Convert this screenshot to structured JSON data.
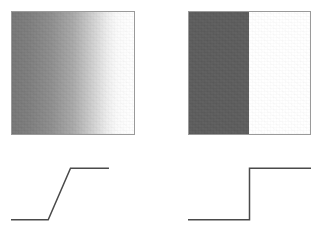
{
  "figure": {
    "background_color": "#ffffff",
    "width": 323,
    "height": 242
  },
  "panels": [
    {
      "id": "ramp",
      "stimulus_label": "gradient ramp edge",
      "profile_label": "gradual intensity ramp profile"
    },
    {
      "id": "step",
      "stimulus_label": "sharp step edge",
      "profile_label": "abrupt intensity step profile"
    }
  ],
  "stimuli": {
    "ramp": {
      "name": "gradient-square",
      "type": "linear-gradient",
      "direction": "left-to-right",
      "border_color": "#9a9a9a",
      "stops": [
        {
          "position_pct": 0,
          "color": "#767676"
        },
        {
          "position_pct": 14,
          "color": "#7d7d7d"
        },
        {
          "position_pct": 32,
          "color": "#8d8d8d"
        },
        {
          "position_pct": 50,
          "color": "#a8a8a8"
        },
        {
          "position_pct": 66,
          "color": "#cfcfcf"
        },
        {
          "position_pct": 78,
          "color": "#ededed"
        },
        {
          "position_pct": 86,
          "color": "#fafafa"
        },
        {
          "position_pct": 100,
          "color": "#ffffff"
        }
      ]
    },
    "step": {
      "name": "step-square",
      "type": "two-tone-step",
      "border_color": "#9a9a9a",
      "dark_color": "#5c5c5c",
      "light_color": "#ffffff",
      "edge_position_pct": 49.6
    }
  },
  "chart_data": [
    {
      "id": "profile-ramp",
      "type": "line",
      "title": "",
      "xlabel": "",
      "ylabel": "",
      "xlim": [
        0,
        100
      ],
      "ylim": [
        0,
        100
      ],
      "grid": false,
      "legend": "none",
      "line_color": "#4a4a4a",
      "line_width": 1.5,
      "series": [
        {
          "name": "intensity",
          "x": [
            0,
            30,
            48,
            79
          ],
          "y": [
            12,
            12,
            88,
            88
          ]
        }
      ],
      "annotation": "low plateau, linear rise, high plateau"
    },
    {
      "id": "profile-step",
      "type": "line",
      "title": "",
      "xlabel": "",
      "ylabel": "",
      "xlim": [
        0,
        100
      ],
      "ylim": [
        0,
        100
      ],
      "grid": false,
      "legend": "none",
      "line_color": "#4a4a4a",
      "line_width": 1.5,
      "series": [
        {
          "name": "intensity",
          "x": [
            0,
            50,
            50,
            100
          ],
          "y": [
            12,
            12,
            88,
            88
          ]
        }
      ],
      "annotation": "low plateau, vertical step, high plateau"
    }
  ]
}
